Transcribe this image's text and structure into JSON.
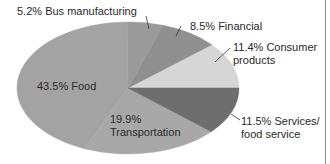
{
  "chart_data": {
    "type": "pie",
    "title": "",
    "slices": [
      {
        "label": "Consumer products",
        "value": 11.4,
        "color": "#d6d6d6"
      },
      {
        "label": "Financial",
        "value": 8.5,
        "color": "#8f8f8f"
      },
      {
        "label": "Bus manufacturing",
        "value": 5.2,
        "color": "#9a9a9a"
      },
      {
        "label": "Food",
        "value": 43.5,
        "color": "#a3a3a3"
      },
      {
        "label": "Transportation",
        "value": 19.9,
        "color": "#a8a8a8"
      },
      {
        "label": "Services/ food service",
        "value": 11.5,
        "color": "#6e6e6e"
      }
    ],
    "legend": "none",
    "grid": false
  },
  "labels": {
    "bus": "5.2% Bus manufacturing",
    "financial": "8.5% Financial",
    "consumer_line1": "11.4% Consumer",
    "consumer_line2": "products",
    "food": "43.5% Food",
    "transport_line1": "19.9%",
    "transport_line2": "Transportation",
    "services_line1": "11.5% Services/",
    "services_line2": "food service"
  }
}
